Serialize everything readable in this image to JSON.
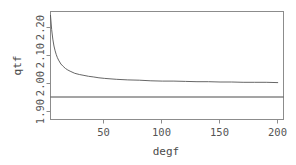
{
  "chart_data": {
    "type": "line",
    "title": "",
    "subtitle": "",
    "xlabel": "degf",
    "ylabel": "qtf",
    "xlim": [
      3,
      205
    ],
    "ylim": [
      1.885,
      2.245
    ],
    "grid": false,
    "legend": null,
    "x_ticks": [
      50,
      100,
      150,
      200
    ],
    "x_tick_labels": [
      "50",
      "100",
      "150",
      "200"
    ],
    "y_ticks": [
      1.9,
      2.0,
      2.1,
      2.2
    ],
    "y_tick_labels": [
      "1.90",
      "2.00",
      "2.10",
      "2.20"
    ],
    "series": [
      {
        "name": "qtf",
        "type": "line",
        "color": "#555555",
        "x": [
          3,
          4,
          5,
          6,
          7,
          8,
          9,
          10,
          12,
          14,
          16,
          18,
          20,
          24,
          28,
          32,
          36,
          40,
          45,
          50,
          60,
          70,
          80,
          90,
          100,
          110,
          120,
          130,
          140,
          150,
          160,
          170,
          180,
          190,
          200
        ],
        "values": [
          2.232,
          2.185,
          2.153,
          2.13,
          2.114,
          2.101,
          2.091,
          2.083,
          2.07,
          2.062,
          2.055,
          2.05,
          2.046,
          2.039,
          2.035,
          2.032,
          2.029,
          2.027,
          2.024,
          2.022,
          2.019,
          2.017,
          2.016,
          2.014,
          2.013,
          2.013,
          2.012,
          2.011,
          2.011,
          2.01,
          2.01,
          2.009,
          2.009,
          2.009,
          2.008
        ]
      },
      {
        "name": "reference-line",
        "type": "hline",
        "color": "#4a4a4a",
        "y": 1.96
      }
    ]
  },
  "axes": {
    "x_title": "degf",
    "y_title": "qtf"
  }
}
